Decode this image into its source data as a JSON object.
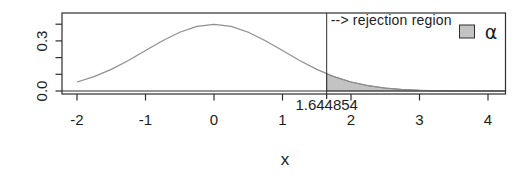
{
  "chart_data": {
    "type": "area",
    "title": "",
    "xlabel": "x",
    "ylabel": "",
    "xlim": [
      -2.3,
      4.3
    ],
    "ylim": [
      0,
      0.46
    ],
    "grid": false,
    "x_ticks": [
      -2,
      -1,
      0,
      1,
      2,
      3,
      4
    ],
    "x_tick_labels": [
      "-2",
      "-1",
      "0",
      "1",
      "2",
      "3",
      "4"
    ],
    "y_ticks": [
      0,
      0.1,
      0.2,
      0.3,
      0.4
    ],
    "y_labels_shown": [
      {
        "value": 0.3,
        "label": "0.3"
      },
      {
        "value": 0.0,
        "label": "0.0"
      }
    ],
    "series": [
      {
        "name": "standard normal density",
        "x": [
          -2,
          -1.75,
          -1.5,
          -1.25,
          -1,
          -0.75,
          -0.5,
          -0.25,
          0,
          0.25,
          0.5,
          0.75,
          1,
          1.25,
          1.5,
          1.75,
          2,
          2.25,
          2.5,
          2.75,
          3,
          3.25,
          3.5,
          3.75,
          4,
          4.25
        ],
        "y": [
          0.053991,
          0.086277,
          0.129518,
          0.182649,
          0.241971,
          0.301137,
          0.352065,
          0.386668,
          0.398942,
          0.386668,
          0.352065,
          0.301137,
          0.241971,
          0.182649,
          0.129518,
          0.086277,
          0.053991,
          0.03174,
          0.017528,
          0.009094,
          0.004432,
          0.002029,
          0.000873,
          0.000353,
          0.000134,
          4.8e-05
        ]
      }
    ],
    "critical_value": 1.644854,
    "critical_value_label": "1.644854",
    "critical_density": 0.103136,
    "shaded_region": {
      "from": 1.644854,
      "to": 4.25
    },
    "annotation": {
      "text": "--> rejection region"
    },
    "legend": {
      "position": "topright",
      "label": "α"
    },
    "colors": {
      "region_fill": "#c3c3c3",
      "region_border": "#7a7a7a",
      "curve": "#8f8f8f",
      "axis": "#2e2e2e",
      "text": "#1d1d1d"
    }
  }
}
